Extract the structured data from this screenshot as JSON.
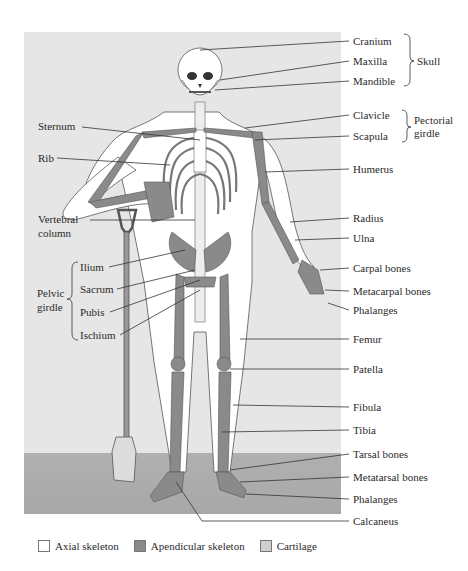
{
  "diagram": {
    "colors": {
      "background_panel": "#e6e6e6",
      "ground": "#adadad",
      "axial_skeleton": "#ffffff",
      "appendicular_skeleton": "#8a8a8a",
      "cartilage": "#cfcfcf",
      "leader_line": "#333333"
    },
    "labels_right": [
      {
        "text": "Cranium",
        "y": 41
      },
      {
        "text": "Maxilla",
        "y": 61
      },
      {
        "text": "Mandible",
        "y": 81
      },
      {
        "text": "Clavicle",
        "y": 115
      },
      {
        "text": "Scapula",
        "y": 136
      },
      {
        "text": "Humerus",
        "y": 169
      },
      {
        "text": "Radius",
        "y": 218
      },
      {
        "text": "Ulna",
        "y": 238
      },
      {
        "text": "Carpal bones",
        "y": 268
      },
      {
        "text": "Metacarpal bones",
        "y": 291
      },
      {
        "text": "Phalanges",
        "y": 310
      },
      {
        "text": "Femur",
        "y": 339
      },
      {
        "text": "Patella",
        "y": 369
      },
      {
        "text": "Fibula",
        "y": 407
      },
      {
        "text": "Tibia",
        "y": 430
      },
      {
        "text": "Tarsal bones",
        "y": 454
      },
      {
        "text": "Metatarsal bones",
        "y": 477
      },
      {
        "text": "Phalanges",
        "y": 499
      },
      {
        "text": "Calcaneus",
        "y": 521
      }
    ],
    "labels_left": [
      {
        "text": "Sternum",
        "y": 126
      },
      {
        "text": "Rib",
        "y": 158
      },
      {
        "text": "Vertebral",
        "y": 219
      },
      {
        "text": "column",
        "y": 233
      }
    ],
    "pelvic_items": [
      {
        "text": "Ilium",
        "y": 267
      },
      {
        "text": "Sacrum",
        "y": 289
      },
      {
        "text": "Pubis",
        "y": 312
      },
      {
        "text": "Ischium",
        "y": 335
      }
    ],
    "groups": {
      "skull": "Skull",
      "pectoral_line1": "Pectorial",
      "pectoral_line2": "girdle",
      "pelvic_line1": "Pelvic",
      "pelvic_line2": "girdle"
    }
  },
  "legend": [
    {
      "label": "Axial skeleton",
      "color": "#ffffff"
    },
    {
      "label": "Apendicular skeleton",
      "color": "#8a8a8a"
    },
    {
      "label": "Cartilage",
      "color": "#cfcfcf"
    }
  ]
}
